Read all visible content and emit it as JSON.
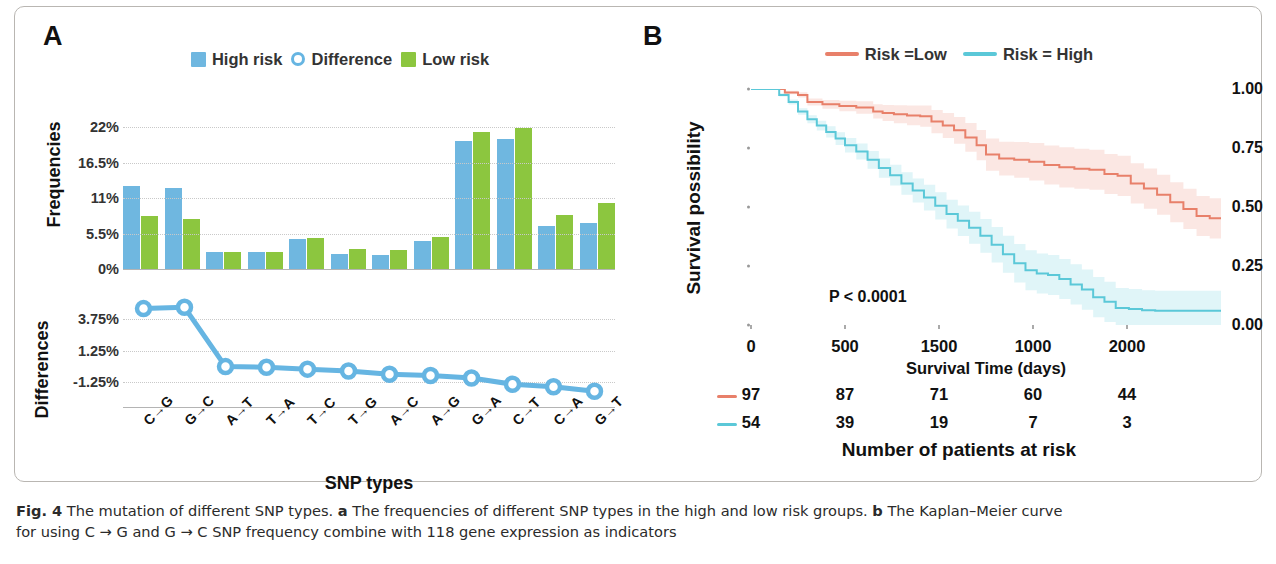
{
  "figure": {
    "caption_prefix": "Fig. 4",
    "caption_line1": " The mutation of different SNP types. ",
    "caption_a_tag": "a",
    "caption_a_text": " The frequencies of different SNP types in the high and low risk groups. ",
    "caption_b_tag": "b",
    "caption_b_text": " The Kaplan–Meier curve",
    "caption_line2": "for using C → G and G → C SNP frequency combine with 118 gene expression as indicators"
  },
  "panel_a": {
    "letter": "A",
    "legend": [
      {
        "label": "High risk",
        "marker": "square",
        "color": "#6FB7E0"
      },
      {
        "label": "Difference",
        "marker": "circle-outline",
        "color": "#66B5E2"
      },
      {
        "label": "Low risk",
        "marker": "square",
        "color": "#8CC63F"
      }
    ],
    "y_axis_frequencies_label": "Frequencies",
    "y_axis_differences_label": "Differences",
    "x_axis_label": "SNP types"
  },
  "panel_b": {
    "letter": "B",
    "legend": [
      {
        "label": "Risk =Low",
        "color": "#E8806A"
      },
      {
        "label": "Risk = High",
        "color": "#5BC8D8"
      }
    ],
    "y_axis_label": "Survival possibility",
    "x_axis_label": "Survival Time (days)",
    "p_value": "P < 0.0001",
    "risk_table_title": "Number of patients at risk"
  },
  "chart_data": [
    {
      "type": "bar",
      "title": "",
      "xlabel": "SNP types",
      "ylabel": "Frequencies",
      "ylim": [
        0,
        24.5
      ],
      "yticks": [
        0,
        5.5,
        11,
        16.5,
        22
      ],
      "ytick_labels": [
        "0%",
        "5.5%",
        "11%",
        "16.5%",
        "22%"
      ],
      "grid": true,
      "legend_position": "top-center",
      "categories": [
        "C->G",
        "G->C",
        "A->T",
        "T->A",
        "T->C",
        "T->G",
        "A->C",
        "A->G",
        "G->A",
        "C->T",
        "C->A",
        "G->T"
      ],
      "series": [
        {
          "name": "High risk",
          "color": "#6FB7E0",
          "values": [
            12.8,
            12.5,
            2.7,
            2.7,
            4.6,
            2.4,
            2.2,
            4.3,
            19.8,
            20.2,
            6.6,
            7.1
          ]
        },
        {
          "name": "Low risk",
          "color": "#8CC63F",
          "values": [
            8.2,
            7.8,
            2.7,
            2.7,
            4.8,
            3.1,
            2.9,
            5.0,
            21.3,
            21.8,
            8.4,
            10.2
          ]
        }
      ]
    },
    {
      "type": "line",
      "title": "",
      "xlabel": "",
      "ylabel": "Differences",
      "ylim": [
        -3.2,
        5.2
      ],
      "yticks": [
        -1.25,
        1.25,
        3.75
      ],
      "ytick_labels": [
        "-1.25%",
        "1.25%",
        "3.75%"
      ],
      "grid": true,
      "marker": "circle-outline",
      "color": "#66B5E2",
      "categories": [
        "C->G",
        "G->C",
        "A->T",
        "T->A",
        "T->C",
        "T->G",
        "A->C",
        "A->G",
        "G->A",
        "C->T",
        "C->A",
        "G->T"
      ],
      "series": [
        {
          "name": "Difference",
          "values": [
            4.6,
            4.7,
            0.0,
            -0.05,
            -0.2,
            -0.35,
            -0.6,
            -0.7,
            -0.9,
            -1.4,
            -1.6,
            -1.95
          ]
        }
      ]
    },
    {
      "type": "line",
      "subtype": "kaplan-meier",
      "title": "",
      "xlabel": "Survival Time (days)",
      "ylabel": "Survival possibility",
      "xlim": [
        0,
        2500
      ],
      "ylim": [
        0,
        1.0
      ],
      "yticks": [
        0.0,
        0.25,
        0.5,
        0.75,
        1.0
      ],
      "ytick_labels": [
        "0.00",
        "0.25",
        "0.50",
        "0.75",
        "1.00"
      ],
      "xtick_labels": [
        "0",
        "500",
        "1500",
        "1000",
        "2000"
      ],
      "xtick_positions": [
        0,
        500,
        1000,
        1500,
        2000
      ],
      "annotation": "P < 0.0001",
      "grid": false,
      "legend_position": "top-center",
      "series": [
        {
          "name": "Risk =Low",
          "color": "#E8806A",
          "points": [
            [
              0,
              1.0
            ],
            [
              120,
              1.0
            ],
            [
              180,
              0.985
            ],
            [
              250,
              0.975
            ],
            [
              300,
              0.945
            ],
            [
              380,
              0.935
            ],
            [
              470,
              0.928
            ],
            [
              560,
              0.922
            ],
            [
              650,
              0.905
            ],
            [
              700,
              0.898
            ],
            [
              760,
              0.893
            ],
            [
              830,
              0.888
            ],
            [
              900,
              0.885
            ],
            [
              960,
              0.862
            ],
            [
              1020,
              0.845
            ],
            [
              1080,
              0.825
            ],
            [
              1140,
              0.795
            ],
            [
              1200,
              0.762
            ],
            [
              1250,
              0.722
            ],
            [
              1320,
              0.705
            ],
            [
              1400,
              0.7
            ],
            [
              1480,
              0.692
            ],
            [
              1560,
              0.678
            ],
            [
              1640,
              0.668
            ],
            [
              1720,
              0.662
            ],
            [
              1800,
              0.658
            ],
            [
              1880,
              0.64
            ],
            [
              1950,
              0.632
            ],
            [
              2020,
              0.6
            ],
            [
              2090,
              0.578
            ],
            [
              2160,
              0.552
            ],
            [
              2230,
              0.52
            ],
            [
              2300,
              0.492
            ],
            [
              2370,
              0.462
            ],
            [
              2440,
              0.452
            ],
            [
              2500,
              0.452
            ]
          ]
        },
        {
          "name": "Risk = High",
          "color": "#5BC8D8",
          "points": [
            [
              0,
              1.0
            ],
            [
              110,
              1.0
            ],
            [
              150,
              0.975
            ],
            [
              200,
              0.945
            ],
            [
              250,
              0.905
            ],
            [
              300,
              0.872
            ],
            [
              350,
              0.845
            ],
            [
              400,
              0.818
            ],
            [
              450,
              0.79
            ],
            [
              500,
              0.762
            ],
            [
              560,
              0.735
            ],
            [
              620,
              0.7
            ],
            [
              680,
              0.665
            ],
            [
              740,
              0.635
            ],
            [
              800,
              0.6
            ],
            [
              860,
              0.57
            ],
            [
              920,
              0.54
            ],
            [
              980,
              0.505
            ],
            [
              1040,
              0.47
            ],
            [
              1100,
              0.442
            ],
            [
              1160,
              0.412
            ],
            [
              1220,
              0.378
            ],
            [
              1280,
              0.34
            ],
            [
              1340,
              0.3
            ],
            [
              1400,
              0.262
            ],
            [
              1460,
              0.232
            ],
            [
              1520,
              0.218
            ],
            [
              1580,
              0.212
            ],
            [
              1640,
              0.195
            ],
            [
              1700,
              0.172
            ],
            [
              1760,
              0.15
            ],
            [
              1820,
              0.118
            ],
            [
              1880,
              0.098
            ],
            [
              1940,
              0.072
            ],
            [
              2010,
              0.068
            ],
            [
              2080,
              0.062
            ],
            [
              2150,
              0.06
            ],
            [
              2250,
              0.06
            ],
            [
              2350,
              0.06
            ],
            [
              2500,
              0.06
            ]
          ]
        }
      ],
      "risk_table": {
        "times": [
          "0",
          "500",
          "1500",
          "1000",
          "2000"
        ],
        "rows": [
          {
            "group": "Risk =Low",
            "color": "#E8806A",
            "counts": [
              "97",
              "87",
              "71",
              "60",
              "44"
            ]
          },
          {
            "group": "Risk = High",
            "color": "#5BC8D8",
            "counts": [
              "54",
              "39",
              "19",
              "7",
              "3"
            ]
          }
        ]
      }
    }
  ]
}
